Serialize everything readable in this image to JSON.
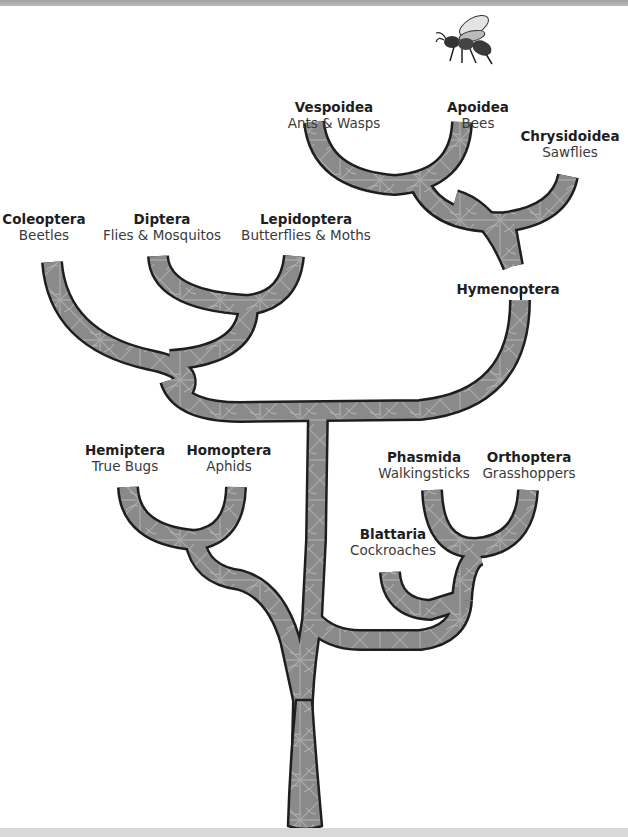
{
  "diagram": {
    "type": "phylogenetic-tree",
    "style": {
      "branch_fill": "#8c8c8c",
      "branch_outline": "#222222",
      "background": "#ffffff"
    },
    "groups": {
      "hymenoptera": {
        "name": "Hymenoptera",
        "common": ""
      },
      "vespoidea": {
        "name": "Vespoidea",
        "common": "Ants & Wasps"
      },
      "apoidea": {
        "name": "Apoidea",
        "common": "Bees"
      },
      "chrysidoidea": {
        "name": "Chrysidoidea",
        "common": "Sawflies"
      },
      "coleoptera": {
        "name": "Coleoptera",
        "common": "Beetles"
      },
      "diptera": {
        "name": "Diptera",
        "common": "Flies & Mosquitos"
      },
      "lepidoptera": {
        "name": "Lepidoptera",
        "common": "Butterflies & Moths"
      },
      "hemiptera": {
        "name": "Hemiptera",
        "common": "True Bugs"
      },
      "homoptera": {
        "name": "Homoptera",
        "common": "Aphids"
      },
      "phasmida": {
        "name": "Phasmida",
        "common": "Walkingsticks"
      },
      "orthoptera": {
        "name": "Orthoptera",
        "common": "Grasshoppers"
      },
      "blattaria": {
        "name": "Blattaria",
        "common": "Cockroaches"
      }
    },
    "illustration": "bee-icon"
  }
}
